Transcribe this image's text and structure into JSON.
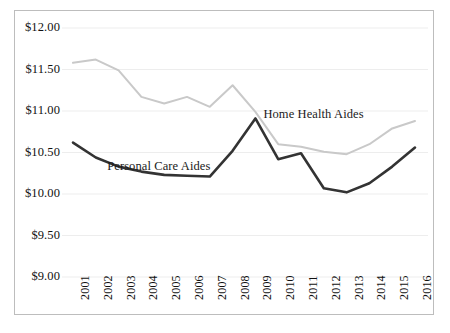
{
  "chart_data": {
    "type": "line",
    "title": "",
    "subtitle": "",
    "xlabel": "",
    "ylabel": "",
    "grid": true,
    "legend_position": "inline-annotation",
    "categories": [
      "2001",
      "2002",
      "2003",
      "2004",
      "2005",
      "2006",
      "2007",
      "2008",
      "2009",
      "2010",
      "2011",
      "2012",
      "2013",
      "2014",
      "2015",
      "2016"
    ],
    "x": [
      2001,
      2002,
      2003,
      2004,
      2005,
      2006,
      2007,
      2008,
      2009,
      2010,
      2011,
      2012,
      2013,
      2014,
      2015,
      2016
    ],
    "ylim": [
      9.0,
      12.0
    ],
    "ytick_values": [
      12.0,
      11.5,
      11.0,
      10.5,
      10.0,
      9.5,
      9.0
    ],
    "ytick_labels": [
      "$12.00",
      "$11.50",
      "$11.00",
      "$10.50",
      "$10.00",
      "$9.50",
      "$9.00"
    ],
    "xtick_labels": [
      "2001",
      "2002",
      "2003",
      "2004",
      "2005",
      "2006",
      "2007",
      "2008",
      "2009",
      "2010",
      "2011",
      "2012",
      "2013",
      "2014",
      "2015",
      "2016"
    ],
    "series": [
      {
        "name": "Home Health Aides",
        "color": "#c9c9c9",
        "values": [
          11.58,
          11.62,
          11.49,
          11.17,
          11.09,
          11.17,
          11.05,
          11.31,
          10.99,
          10.6,
          10.57,
          10.51,
          10.48,
          10.6,
          10.79,
          10.88
        ]
      },
      {
        "name": "Personal Care Aides",
        "color": "#333333",
        "values": [
          10.62,
          10.44,
          10.33,
          10.27,
          10.23,
          10.22,
          10.21,
          10.52,
          10.91,
          10.42,
          10.49,
          10.07,
          10.02,
          10.13,
          10.33,
          10.56
        ]
      }
    ],
    "annotations": [
      {
        "text": "Home Health Aides",
        "x": 2009.35,
        "y": 10.95
      },
      {
        "text": "Personal Care Aides",
        "x": 2002.5,
        "y": 10.33
      }
    ]
  },
  "colors": {
    "home_health_aides": "#c9c9c9",
    "personal_care_aides": "#333333",
    "gridline": "#ededed",
    "frame_border": "#bdbdbd",
    "background": "#ffffff",
    "text": "#111111"
  }
}
